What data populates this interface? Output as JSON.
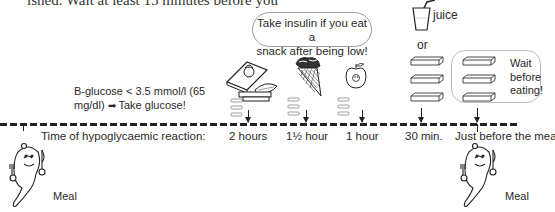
{
  "top_text": "ished. Wait at least 15 minutes before you",
  "insulin_bubble": {
    "line1": "Take insulin if you eat a",
    "line2": "snack after being low!"
  },
  "juice_label": "juice",
  "or_label": "or",
  "wait_bubble": {
    "line1": "Wait",
    "line2": "before",
    "line3": "eating!"
  },
  "glucose_note": {
    "line1": "B-glucose < 3.5 mmol/l (65",
    "line2_prefix": "mg/dl)",
    "arrow": "➡",
    "line2_suffix": "Take glucose!"
  },
  "timeline": {
    "label": "Time of hypoglycaemic reaction:",
    "points": [
      {
        "label": "2 hours",
        "food": "sandwich"
      },
      {
        "label": "1½ hour",
        "food": "ice-cream-cone"
      },
      {
        "label": "1 hour",
        "food": "apple"
      },
      {
        "label": "30 min.",
        "food": "juice-or-glucose"
      },
      {
        "label": "Just before the meal",
        "food": "glucose-then-wait"
      }
    ]
  },
  "meal_left_label": "Meal",
  "meal_right_label": "Meal"
}
